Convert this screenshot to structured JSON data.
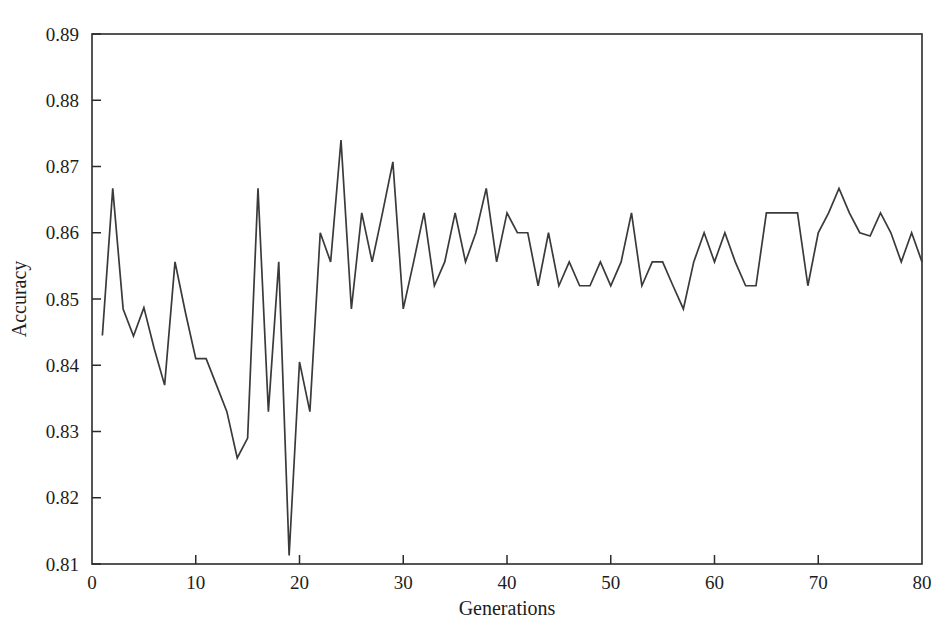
{
  "chart_data": {
    "type": "line",
    "title": "",
    "xlabel": "Generations",
    "ylabel": "Accuracy",
    "xlim": [
      0,
      80
    ],
    "ylim": [
      0.81,
      0.89
    ],
    "xticks": [
      0,
      10,
      20,
      30,
      40,
      50,
      60,
      70,
      80
    ],
    "xtick_labels": [
      "0",
      "10",
      "20",
      "30",
      "40",
      "50",
      "60",
      "70",
      "80"
    ],
    "yticks": [
      0.81,
      0.82,
      0.83,
      0.84,
      0.85,
      0.86,
      0.87,
      0.88,
      0.89
    ],
    "ytick_labels": [
      "0.81",
      "0.82",
      "0.83",
      "0.84",
      "0.85",
      "0.86",
      "0.87",
      "0.88",
      "0.89"
    ],
    "grid": false,
    "legend": false,
    "line_color": "#3a3a3a",
    "frame_color": "#2b2b2b",
    "background_color": "#ffffff",
    "series": [
      {
        "name": "Accuracy",
        "x": [
          1,
          2,
          3,
          4,
          5,
          6,
          7,
          8,
          9,
          10,
          11,
          12,
          13,
          14,
          15,
          16,
          17,
          18,
          19,
          20,
          21,
          22,
          23,
          24,
          25,
          26,
          27,
          28,
          29,
          30,
          31,
          32,
          33,
          34,
          35,
          36,
          37,
          38,
          39,
          40,
          41,
          42,
          43,
          44,
          45,
          46,
          47,
          48,
          49,
          50,
          51,
          52,
          53,
          54,
          55,
          56,
          57,
          58,
          59,
          60,
          61,
          62,
          63,
          64,
          65,
          66,
          67,
          68,
          69,
          70,
          71,
          72,
          73,
          74,
          75,
          76,
          77,
          78,
          79,
          80
        ],
        "values": [
          0.8445,
          0.8667,
          0.8485,
          0.8444,
          0.8487,
          0.8425,
          0.837,
          0.8556,
          0.848,
          0.841,
          0.841,
          0.837,
          0.833,
          0.826,
          0.829,
          0.8667,
          0.833,
          0.8556,
          0.8113,
          0.8405,
          0.833,
          0.86,
          0.8556,
          0.874,
          0.8485,
          0.863,
          0.8556,
          0.863,
          0.8707,
          0.8485,
          0.8556,
          0.863,
          0.852,
          0.8556,
          0.863,
          0.8556,
          0.86,
          0.8667,
          0.8556,
          0.863,
          0.86,
          0.86,
          0.852,
          0.86,
          0.852,
          0.8556,
          0.852,
          0.852,
          0.8556,
          0.852,
          0.8556,
          0.863,
          0.852,
          0.8556,
          0.8556,
          0.852,
          0.8485,
          0.8556,
          0.86,
          0.8556,
          0.86,
          0.8556,
          0.852,
          0.852,
          0.863,
          0.863,
          0.863,
          0.863,
          0.852,
          0.86,
          0.863,
          0.8667,
          0.863,
          0.86,
          0.8595,
          0.863,
          0.86,
          0.8556,
          0.86,
          0.8556
        ]
      }
    ]
  },
  "axes": {
    "y_title": "Accuracy",
    "x_title": "Generations"
  }
}
